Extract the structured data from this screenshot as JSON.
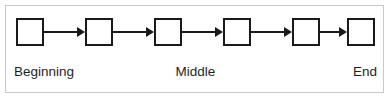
{
  "figure": {
    "type": "linear-chain-diagram",
    "width": 391,
    "height": 101,
    "background_color": "#ffffff",
    "frame_color": "#c9c9c9",
    "node_border_color": "#1a1a1a",
    "arrow_color": "#1a1a1a",
    "text_color": "#1f1f1f",
    "node_count": 6,
    "arrow_count": 5
  },
  "nodes": [
    {
      "index": 1,
      "label": "",
      "x": 16
    },
    {
      "index": 2,
      "label": "",
      "x": 85
    },
    {
      "index": 3,
      "label": "",
      "x": 154
    },
    {
      "index": 4,
      "label": "",
      "x": 223
    },
    {
      "index": 5,
      "label": "",
      "x": 292
    },
    {
      "index": 6,
      "label": "",
      "x": 347
    }
  ],
  "arrows": [
    {
      "index": 1,
      "from_node": 1,
      "to_node": 2,
      "x": 44,
      "width": 41
    },
    {
      "index": 2,
      "from_node": 2,
      "to_node": 3,
      "x": 113,
      "width": 41
    },
    {
      "index": 3,
      "from_node": 3,
      "to_node": 4,
      "x": 182,
      "width": 41
    },
    {
      "index": 4,
      "from_node": 4,
      "to_node": 5,
      "x": 251,
      "width": 41
    },
    {
      "index": 5,
      "from_node": 5,
      "to_node": 6,
      "x": 320,
      "width": 27
    }
  ],
  "captions": {
    "beginning": "Beginning",
    "middle": "Middle",
    "end": "End"
  }
}
